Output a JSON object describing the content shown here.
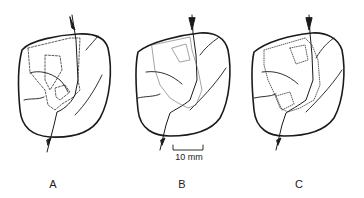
{
  "figure": {
    "panels": [
      {
        "id": "A",
        "label": "A",
        "contour_style": "dashed"
      },
      {
        "id": "B",
        "label": "B",
        "contour_style": "solid-thin"
      },
      {
        "id": "C",
        "label": "C",
        "contour_style": "dotted"
      }
    ],
    "scale_bar": {
      "label": "10 mm"
    },
    "colors": {
      "ink": "#1a1a1a",
      "background": "#ffffff"
    }
  }
}
